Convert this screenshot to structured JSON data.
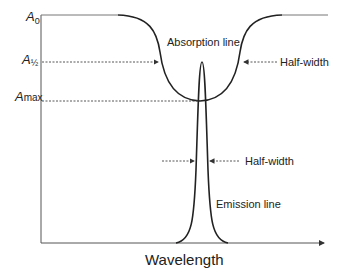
{
  "diagram": {
    "y_labels": {
      "a0": {
        "base": "A",
        "sub": "0"
      },
      "ahalf": {
        "base": "A",
        "sub": "½"
      },
      "amax": {
        "base": "A",
        "sub": "max"
      }
    },
    "absorption_label": "Absorption line",
    "emission_label": "Emission line",
    "halfwidth_abs_label": "Half-width",
    "halfwidth_em_label": "Half-width",
    "x_axis_label": "Wavelength"
  }
}
